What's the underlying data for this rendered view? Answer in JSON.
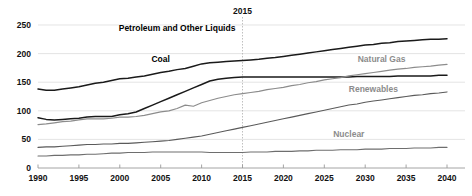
{
  "chart_data": {
    "type": "line",
    "title": "",
    "xlabel": "",
    "ylabel": "",
    "xlim": [
      1990,
      2040
    ],
    "ylim": [
      0,
      250
    ],
    "grid": true,
    "legend_position": "inline-labels",
    "annotations": [
      {
        "text": "2015",
        "x": 2015,
        "kind": "vertical-divider-history-projection"
      }
    ],
    "ytick_labels": [
      "0",
      "50",
      "100",
      "150",
      "200",
      "250"
    ],
    "ytick_values": [
      0,
      50,
      100,
      150,
      200,
      250
    ],
    "xtick_labels": [
      "1990",
      "1995",
      "2000",
      "2005",
      "2010",
      "2015",
      "2020",
      "2025",
      "2030",
      "2035",
      "2040"
    ],
    "xtick_values": [
      1990,
      1995,
      2000,
      2005,
      2010,
      2015,
      2020,
      2025,
      2030,
      2035,
      2040
    ],
    "x": [
      1990,
      1991,
      1992,
      1993,
      1994,
      1995,
      1996,
      1997,
      1998,
      1999,
      2000,
      2001,
      2002,
      2003,
      2004,
      2005,
      2006,
      2007,
      2008,
      2009,
      2010,
      2011,
      2012,
      2013,
      2014,
      2015,
      2016,
      2017,
      2018,
      2019,
      2020,
      2021,
      2022,
      2023,
      2024,
      2025,
      2026,
      2027,
      2028,
      2029,
      2030,
      2031,
      2032,
      2033,
      2034,
      2035,
      2036,
      2037,
      2038,
      2039,
      2040
    ],
    "series": [
      {
        "name": "Petroleum and Other Liquids",
        "color": "#1a1a1a",
        "width": 1.5,
        "label_x": 2007,
        "label_y": 240,
        "values": [
          138,
          136,
          136,
          138,
          140,
          142,
          145,
          148,
          150,
          153,
          156,
          157,
          159,
          161,
          164,
          167,
          169,
          172,
          174,
          178,
          182,
          184,
          185,
          186,
          187,
          188,
          189,
          190,
          192,
          193,
          195,
          197,
          199,
          201,
          203,
          205,
          207,
          209,
          211,
          213,
          215,
          216,
          218,
          219,
          221,
          222,
          223,
          224,
          225,
          225,
          226
        ]
      },
      {
        "name": "Coal",
        "color": "#1a1a1a",
        "width": 1.5,
        "label_x": 2005,
        "label_y": 185,
        "values": [
          88,
          85,
          84,
          85,
          86,
          87,
          89,
          90,
          90,
          90,
          93,
          95,
          98,
          104,
          110,
          116,
          122,
          128,
          134,
          140,
          146,
          152,
          155,
          157,
          158,
          159,
          159,
          159,
          159,
          159,
          159,
          159,
          159,
          159,
          159,
          159,
          159,
          159,
          159,
          160,
          160,
          160,
          160,
          160,
          161,
          161,
          161,
          161,
          161,
          162,
          162
        ]
      },
      {
        "name": "Natural Gas",
        "color": "#8c8c8c",
        "width": 1.2,
        "label_x": 2032,
        "label_y": 185,
        "values": [
          76,
          77,
          79,
          81,
          82,
          84,
          86,
          86,
          86,
          87,
          89,
          89,
          90,
          92,
          95,
          98,
          100,
          104,
          110,
          108,
          114,
          118,
          122,
          125,
          128,
          130,
          132,
          134,
          137,
          139,
          141,
          144,
          146,
          149,
          151,
          154,
          156,
          158,
          161,
          163,
          165,
          167,
          169,
          171,
          173,
          174,
          176,
          177,
          178,
          180,
          181
        ]
      },
      {
        "name": "Renewables",
        "color": "#5a5a5a",
        "width": 1.1,
        "label_x": 2031,
        "label_y": 133,
        "values": [
          36,
          37,
          37,
          38,
          39,
          40,
          41,
          41,
          42,
          42,
          43,
          43,
          44,
          45,
          46,
          47,
          48,
          50,
          52,
          54,
          56,
          59,
          62,
          65,
          68,
          71,
          74,
          77,
          80,
          83,
          86,
          89,
          92,
          95,
          98,
          101,
          104,
          107,
          110,
          112,
          115,
          117,
          119,
          121,
          123,
          125,
          127,
          128,
          130,
          131,
          133
        ]
      },
      {
        "name": "Nuclear",
        "color": "#6e6e6e",
        "width": 1.1,
        "label_x": 2028,
        "label_y": 55,
        "values": [
          21,
          21,
          22,
          22,
          23,
          23,
          24,
          24,
          25,
          26,
          26,
          27,
          27,
          27,
          28,
          28,
          28,
          28,
          28,
          28,
          28,
          27,
          27,
          27,
          27,
          27,
          28,
          28,
          28,
          29,
          29,
          29,
          30,
          30,
          31,
          31,
          31,
          32,
          32,
          32,
          33,
          33,
          33,
          34,
          34,
          34,
          35,
          35,
          35,
          36,
          36
        ]
      }
    ]
  }
}
